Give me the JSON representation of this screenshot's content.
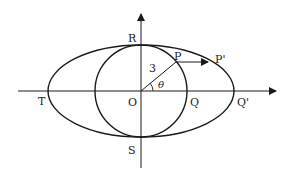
{
  "diagram": {
    "type": "geometry",
    "labels": {
      "origin": "O",
      "top": "R",
      "bottom": "S",
      "left": "T",
      "circle_right": "Q",
      "ellipse_right": "Q'",
      "circle_point": "P",
      "ellipse_point": "P'",
      "radius": "3",
      "angle": "θ"
    },
    "colors": {
      "stroke": "#1a1a1a",
      "background": "#ffffff"
    }
  }
}
